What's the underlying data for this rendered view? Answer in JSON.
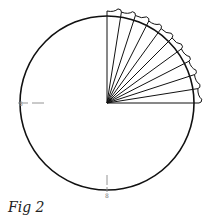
{
  "figure": {
    "caption": "Fig 2",
    "circle": {
      "cx": 107,
      "cy": 103,
      "r": 87,
      "stroke": "#111111"
    },
    "fan": {
      "spokes": 10,
      "start_deg": -90,
      "end_deg": 0,
      "outer_r": 92,
      "stroke": "#111111"
    },
    "marks": [
      {
        "name": "left-mark",
        "x": 20,
        "y": 103,
        "orientation": "horizontal",
        "label": "8"
      },
      {
        "name": "bottom-mark",
        "x": 107,
        "y": 190,
        "orientation": "vertical",
        "label": "8"
      }
    ],
    "mark_color": "#888888"
  }
}
